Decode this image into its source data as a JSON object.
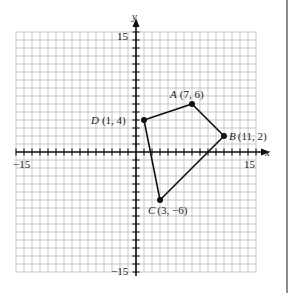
{
  "figure": {
    "type": "coordinate-plane",
    "x_axis_label": "x",
    "y_axis_label": "y",
    "x_range": [
      -15,
      15
    ],
    "y_range": [
      -15,
      15
    ],
    "tick_labels": {
      "x_min": "−15",
      "x_max": "15",
      "y_max": "15",
      "y_min": "−15"
    },
    "grid_color": "#b0b0b0",
    "axis_color": "#111111",
    "shape_color": "#111111"
  },
  "points": [
    {
      "name": "A",
      "coords": "(7, 6)",
      "x": 7,
      "y": 6
    },
    {
      "name": "B",
      "coords": "(11, 2)",
      "x": 11,
      "y": 2
    },
    {
      "name": "C",
      "coords": "(3, −6)",
      "x": 3,
      "y": -6
    },
    {
      "name": "D",
      "coords": "(1, 4)",
      "x": 1,
      "y": 4
    }
  ],
  "polygon_order": [
    "A",
    "B",
    "C",
    "D"
  ]
}
